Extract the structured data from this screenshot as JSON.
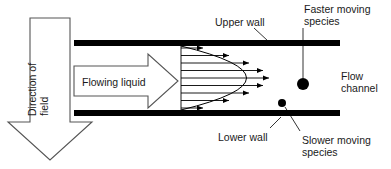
{
  "figure": {
    "width": 391,
    "height": 169,
    "background": "#ffffff",
    "ink_color": "#000000",
    "text_color": "#1a1a1a",
    "outline_color": "#555555"
  },
  "labels": {
    "upper_wall": "Upper wall",
    "lower_wall": "Lower wall",
    "faster_species": "Faster moving\nspecies",
    "slower_species": "Slower moving\nspecies",
    "flow_channel": "Flow\nchannel",
    "flowing_liquid": "Flowing liquid",
    "direction_of_field": "Direction of\nfield"
  },
  "diagram": {
    "walls": {
      "upper": {
        "x": 74,
        "y": 40,
        "width": 266,
        "height": 6,
        "color": "#000000"
      },
      "lower": {
        "x": 74,
        "y": 110,
        "width": 266,
        "height": 6,
        "color": "#000000"
      }
    },
    "field_arrow": {
      "description": "large hollow downward block arrow at left",
      "shaft_left": 30,
      "shaft_right": 70,
      "shaft_top": 18,
      "head_top": 122,
      "head_left": 8,
      "head_right": 92,
      "tip_y": 160,
      "fill": "#ffffff",
      "stroke": "#555555"
    },
    "flow_arrow": {
      "description": "hollow right-pointing block arrow labelled Flowing liquid",
      "body_left": 74,
      "body_right": 148,
      "body_top": 66,
      "body_bottom": 96,
      "head_top": 54,
      "head_bottom": 108,
      "tip_x": 178,
      "fill": "#ffffff",
      "stroke": "#555555"
    },
    "velocity_profile": {
      "description": "parabolic laminar flow velocity profile drawn as horizontal arrows",
      "base_x": 181,
      "arrow_count": 9,
      "arrow_tip_lengths": [
        22,
        48,
        68,
        82,
        88,
        82,
        68,
        48,
        22
      ],
      "arrow_y": [
        48,
        55.5,
        63,
        70.5,
        78,
        85.5,
        93,
        100.5,
        108
      ],
      "parabola_vertex_x": 269,
      "parabola_vertex_y": 78,
      "color": "#000000"
    },
    "particles": [
      {
        "name": "faster-moving-species",
        "cx": 303,
        "cy": 84,
        "r": 6.0,
        "color": "#000000"
      },
      {
        "name": "slower-moving-species",
        "cx": 282,
        "cy": 103,
        "r": 4.0,
        "color": "#000000"
      }
    ],
    "leader_lines": [
      {
        "name": "upper-wall-leader",
        "x1": 254,
        "y1": 28,
        "x2": 268,
        "y2": 41
      },
      {
        "name": "faster-species-leader",
        "x1": 303,
        "y1": 28,
        "x2": 303,
        "y2": 78
      },
      {
        "name": "lower-wall-leader",
        "x1": 270,
        "y1": 128,
        "x2": 281,
        "y2": 117
      },
      {
        "name": "slower-species-leader",
        "x1": 300,
        "y1": 131,
        "x2": 285,
        "y2": 107
      }
    ]
  }
}
